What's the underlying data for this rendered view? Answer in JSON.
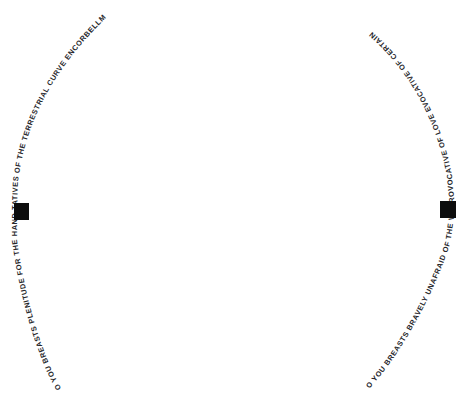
{
  "page": {
    "background_color": "#ffffff",
    "text_color": "#26262a",
    "accent_color": "#0d0d0d",
    "width": 473,
    "height": 408
  },
  "left_arc": {
    "name": "left-breast-arc",
    "reading_direction": "bottom-to-top",
    "segment_before_nipple": "O YOU BREASTS PLENITUDE FOR THE HANDS REPRESEN-",
    "segment_after_nipple": "TATIVES OF THE TERRESTRIAL CURVE ENCORBELLMENTS",
    "full_text": "O YOU BREASTS PLENITUDE FOR THE HANDS REPRESEN-TATIVES OF THE TERRESTRIAL CURVE ENCORBELLMENTS"
  },
  "right_arc": {
    "name": "right-breast-arc",
    "reading_direction": "bottom-to-top",
    "segment_before_nipple": "O YOU BREASTS BRAVELY UNAFRAID OF THE VOID",
    "segment_after_nipple": "PROVOCATIVE OF LOVE EVOCATIVE OF CERTAINTY",
    "full_text": "O YOU BREASTS BRAVELY UNAFRAID OF THE VOID PROVOCATIVE OF LOVE EVOCATIVE OF CERTAINTY"
  },
  "marks": {
    "left_nipple_label": "nipple-square-left",
    "right_nipple_label": "nipple-square-right"
  }
}
